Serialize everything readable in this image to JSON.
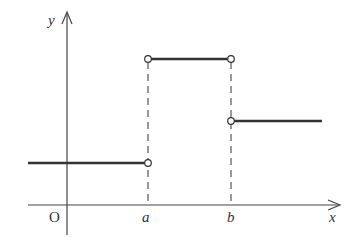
{
  "diagram": {
    "type": "step-function-graph",
    "axes": {
      "x_label": "x",
      "y_label": "y",
      "origin_label": "O"
    },
    "tick_labels": {
      "a": "a",
      "b": "b"
    },
    "segments": [
      {
        "name": "left",
        "from": "-inf",
        "to": "a",
        "level": "low",
        "end": "open"
      },
      {
        "name": "middle",
        "from": "a",
        "to": "b",
        "level": "high",
        "start": "open",
        "end": "open"
      },
      {
        "name": "right",
        "from": "b",
        "to": "inf",
        "level": "mid",
        "start": "open"
      }
    ],
    "colors": {
      "line": "#333333",
      "background": "#ffffff"
    }
  }
}
